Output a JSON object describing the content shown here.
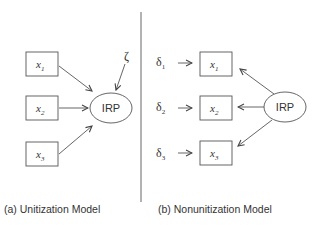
{
  "panels": {
    "a": {
      "caption": "(a) Unitization Model",
      "indicators": [
        {
          "var": "x",
          "sub": "1"
        },
        {
          "var": "x",
          "sub": "2"
        },
        {
          "var": "x",
          "sub": "3"
        }
      ],
      "latent": "IRP",
      "disturbance": "ζ"
    },
    "b": {
      "caption": "(b) Nonunitization Model",
      "indicators": [
        {
          "var": "x",
          "sub": "1",
          "error": "δ",
          "error_sub": "1"
        },
        {
          "var": "x",
          "sub": "2",
          "error": "δ",
          "error_sub": "2"
        },
        {
          "var": "x",
          "sub": "3",
          "error": "δ",
          "error_sub": "3"
        }
      ],
      "latent": "IRP"
    }
  },
  "colors": {
    "stroke": "#555555",
    "text": "#333333"
  }
}
